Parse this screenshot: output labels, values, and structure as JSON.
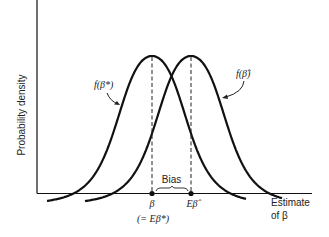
{
  "figure": {
    "y_axis_label": "Probability density",
    "x_axis_label_line1": "Estimate",
    "x_axis_label_line2": "of β",
    "curve_left_label": "f(β*)",
    "curve_right_label": "f(β̂)",
    "bias_label": "Bias",
    "tick_left_label": "β",
    "tick_left_sublabel": "(= Eβ*)",
    "tick_right_label": "Eβ̂",
    "line_color": "#111111"
  },
  "chart_data": {
    "type": "line",
    "title": "",
    "xlabel": "Estimate of β",
    "ylabel": "Probability density",
    "series": [
      {
        "name": "f(β*)",
        "center_label": "β (= Eβ*)",
        "shape": "bell"
      },
      {
        "name": "f(β̂)",
        "center_label": "Eβ̂",
        "shape": "bell"
      }
    ],
    "annotations": [
      "Bias"
    ],
    "grid": false
  }
}
